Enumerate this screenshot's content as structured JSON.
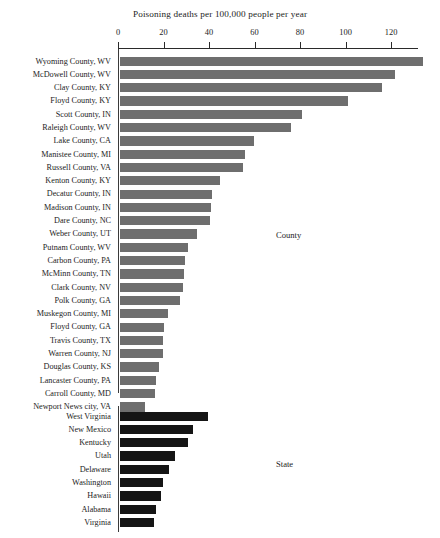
{
  "chart_data": {
    "type": "bar",
    "orientation": "horizontal",
    "title": "Poisoning deaths per 100,000 people per year",
    "xlabel": "",
    "ylabel": "",
    "xlim": [
      0,
      133
    ],
    "xticks": [
      0,
      20,
      40,
      60,
      80,
      100,
      120
    ],
    "xtick_labels": [
      "0",
      "20",
      "40",
      "60",
      "80",
      "100",
      "120"
    ],
    "grid": false,
    "legend": "none",
    "panels": [
      {
        "name": "County",
        "annotation": "County",
        "bar_color": "#6e6e6e",
        "categories": [
          "Wyoming County, WV",
          "McDowell County, WV",
          "Clay County, KY",
          "Floyd County, KY",
          "Scott County, IN",
          "Raleigh County, WV",
          "Lake County, CA",
          "Manistee County, MI",
          "Russell County, VA",
          "Kenton County, KY",
          "Decatur County, IN",
          "Madison County, IN",
          "Dare County, NC",
          "Weber County, UT",
          "Putnam County, WV",
          "Carbon County, PA",
          "McMinn County, TN",
          "Clark County, NV",
          "Polk County, GA",
          "Muskegon County, MI",
          "Floyd County, GA",
          "Travis County, TX",
          "Warren County, NJ",
          "Douglas County, KS",
          "Lancaster County, PA",
          "Carroll County, MD",
          "Newport News city, VA"
        ],
        "values": [
          133.0,
          121.0,
          115.0,
          100.0,
          80.0,
          75.0,
          59.0,
          55.0,
          54.0,
          44.0,
          40.5,
          40.0,
          39.5,
          34.0,
          30.0,
          28.5,
          28.0,
          27.5,
          26.5,
          21.0,
          19.5,
          19.0,
          19.0,
          17.0,
          16.0,
          15.5,
          11.0
        ]
      },
      {
        "name": "State",
        "annotation": "State",
        "bar_color": "#151515",
        "categories": [
          "West Virginia",
          "New Mexico",
          "Kentucky",
          "Utah",
          "Delaware",
          "Washington",
          "Hawaii",
          "Alabama",
          "Virginia"
        ],
        "values": [
          38.5,
          32.0,
          30.0,
          24.0,
          21.5,
          19.0,
          18.0,
          16.0,
          15.0
        ]
      }
    ]
  },
  "colors": {
    "county_bar": "#6e6e6e",
    "state_bar": "#151515",
    "axis": "#2a2a2a",
    "text": "#1d1d1d",
    "background": "#ffffff"
  }
}
